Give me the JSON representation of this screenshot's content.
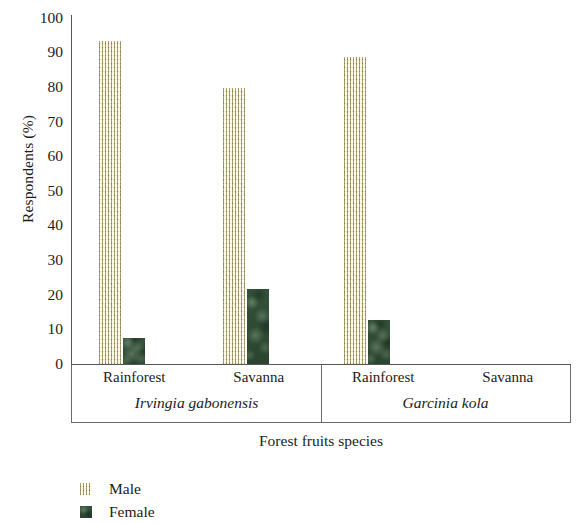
{
  "chart_data": {
    "type": "bar",
    "title": "",
    "xlabel": "Forest fruits species",
    "ylabel": "Respondents (%)",
    "ylim": [
      0,
      100
    ],
    "ytick_step": 10,
    "yticks": [
      100,
      90,
      80,
      70,
      60,
      50,
      40,
      30,
      20,
      10,
      0
    ],
    "grid": false,
    "legend_position": "bottom-left",
    "groups": [
      {
        "species": "Irvingia gabonensis",
        "categories": [
          "Rainforest",
          "Savanna"
        ]
      },
      {
        "species": "Garcinia kola",
        "categories": [
          "Rainforest",
          "Savanna"
        ]
      }
    ],
    "categories": [
      "Irvingia gabonensis / Rainforest",
      "Irvingia gabonensis / Savanna",
      "Garcinia kola / Rainforest",
      "Garcinia kola / Savanna"
    ],
    "series": [
      {
        "name": "Male",
        "color": "#ded6b4",
        "texture": "beige-crosshatch",
        "values": [
          92.5,
          79,
          88,
          0
        ]
      },
      {
        "name": "Female",
        "color": "#2f4a33",
        "texture": "dark-green-mottled",
        "values": [
          7.5,
          21.5,
          12.5,
          0
        ]
      }
    ]
  },
  "axes": {
    "y_title": "Respondents (%)",
    "x_title": "Forest fruits species",
    "y_tick_labels": [
      "100",
      "90",
      "80",
      "70",
      "60",
      "50",
      "40",
      "30",
      "20",
      "10",
      "0"
    ]
  },
  "groups": [
    {
      "species": "Irvingia gabonensis",
      "regions": [
        "Rainforest",
        "Savanna"
      ]
    },
    {
      "species": "Garcinia kola",
      "regions": [
        "Rainforest",
        "Savanna"
      ]
    }
  ],
  "legend": {
    "items": [
      {
        "label": "Male",
        "swatch": "male-texture-swatch"
      },
      {
        "label": "Female",
        "swatch": "female-texture-swatch"
      }
    ]
  }
}
